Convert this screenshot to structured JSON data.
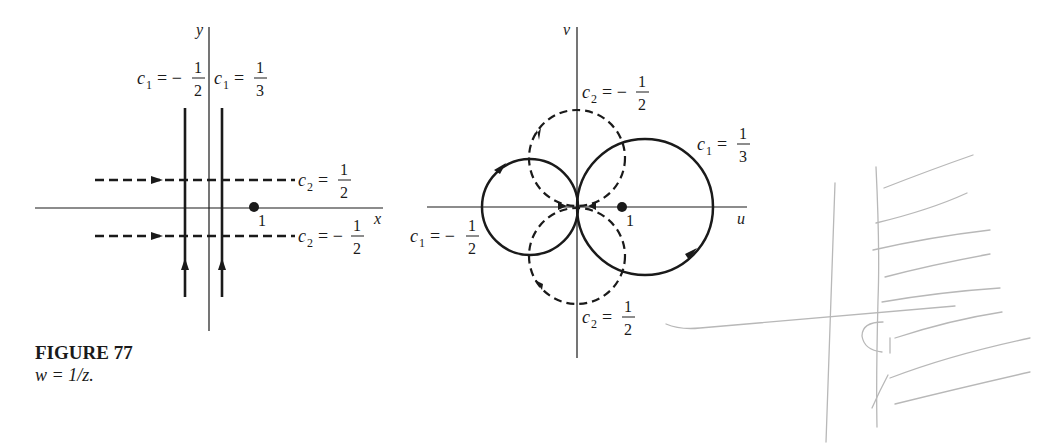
{
  "figure": {
    "title": "FIGURE 77",
    "caption": "w = 1/z."
  },
  "z_plane": {
    "x_axis_label": "x",
    "y_axis_label": "y",
    "point_label": "1",
    "vertical_lines": [
      {
        "name": "c1",
        "value_label": "c₁ = −",
        "num": "1",
        "den": "2",
        "style": "solid"
      },
      {
        "name": "c1",
        "value_label": "c₁ =",
        "num": "1",
        "den": "3",
        "style": "solid"
      }
    ],
    "horizontal_lines": [
      {
        "name": "c2",
        "value_label": "c₂ =",
        "num": "1",
        "den": "2",
        "style": "dashed"
      },
      {
        "name": "c2",
        "value_label": "c₂ = −",
        "num": "1",
        "den": "2",
        "style": "dashed"
      }
    ]
  },
  "w_plane": {
    "u_axis_label": "u",
    "v_axis_label": "v",
    "point_label": "1",
    "circles": [
      {
        "name": "c1",
        "value_label": "c₁ =",
        "num": "1",
        "den": "3",
        "style": "solid"
      },
      {
        "name": "c1",
        "value_label": "c₁ = −",
        "num": "1",
        "den": "2",
        "style": "solid"
      },
      {
        "name": "c2",
        "value_label": "c₂ = −",
        "num": "1",
        "den": "2",
        "style": "dashed"
      },
      {
        "name": "c2",
        "value_label": "c₂ =",
        "num": "1",
        "den": "2",
        "style": "dashed"
      }
    ]
  },
  "annotation": {
    "handwritten_label": "C₁"
  },
  "colors": {
    "ink": "#1a1a1a",
    "pencil": "#b8b8b8"
  }
}
